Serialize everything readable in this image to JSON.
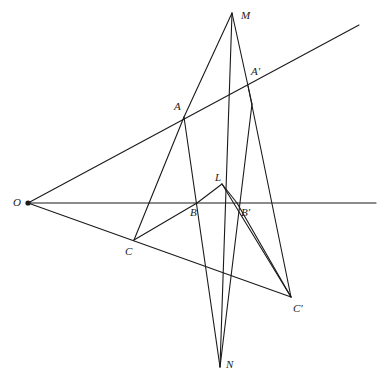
{
  "figure": {
    "kind": "geometry-diagram",
    "background_color": "#ffffff",
    "stroke_color": "#1a1a1a",
    "stroke_width": 1.1,
    "canvas": {
      "width": 382,
      "height": 383
    }
  },
  "points": [
    {
      "id": "O",
      "label": "O",
      "x": 28,
      "y": 203,
      "label_x": 13,
      "label_y": 197,
      "dot": true
    },
    {
      "id": "M",
      "label": "M",
      "x": 232,
      "y": 13,
      "label_x": 241,
      "label_y": 10,
      "dot": false
    },
    {
      "id": "Ap",
      "label": "A′",
      "x": 248,
      "y": 86,
      "label_x": 251,
      "label_y": 66,
      "dot": false
    },
    {
      "id": "A",
      "label": "A",
      "x": 184,
      "y": 117,
      "label_x": 174,
      "label_y": 101,
      "dot": false
    },
    {
      "id": "L",
      "label": "L",
      "x": 222,
      "y": 184,
      "label_x": 215,
      "label_y": 172,
      "dot": false
    },
    {
      "id": "B",
      "label": "B",
      "x": 197,
      "y": 203,
      "label_x": 190,
      "label_y": 207,
      "dot": false
    },
    {
      "id": "Bp",
      "label": "B′",
      "x": 237,
      "y": 203,
      "label_x": 241,
      "label_y": 207,
      "dot": false
    },
    {
      "id": "C",
      "label": "C",
      "x": 134,
      "y": 240,
      "label_x": 125,
      "label_y": 246,
      "dot": false
    },
    {
      "id": "Cp",
      "label": "C′",
      "x": 291,
      "y": 297,
      "label_x": 293,
      "label_y": 303,
      "dot": false
    },
    {
      "id": "N",
      "label": "N",
      "x": 220,
      "y": 367,
      "label_x": 226,
      "label_y": 359,
      "dot": false
    }
  ],
  "segments": [
    {
      "name": "line-O-horizontal-axis",
      "x1": 28,
      "y1": 203,
      "x2": 376,
      "y2": 203
    },
    {
      "name": "line-O-through-A-to-Ap",
      "x1": 28,
      "y1": 203,
      "x2": 359,
      "y2": 25
    },
    {
      "name": "line-O-through-C-to-Cp",
      "x1": 28,
      "y1": 203,
      "x2": 291,
      "y2": 297
    },
    {
      "name": "segment-M-to-A",
      "x1": 232,
      "y1": 13,
      "x2": 184,
      "y2": 117
    },
    {
      "name": "segment-A-to-C",
      "x1": 184,
      "y1": 117,
      "x2": 134,
      "y2": 240
    },
    {
      "name": "segment-C-to-B",
      "x1": 134,
      "y1": 240,
      "x2": 197,
      "y2": 203
    },
    {
      "name": "segment-B-to-L",
      "x1": 197,
      "y1": 203,
      "x2": 222,
      "y2": 184
    },
    {
      "name": "segment-L-to-Bp",
      "x1": 222,
      "y1": 184,
      "x2": 237,
      "y2": 203
    },
    {
      "name": "segment-L-to-Cp",
      "x1": 222,
      "y1": 184,
      "x2": 291,
      "y2": 297
    },
    {
      "name": "segment-M-to-N-left",
      "x1": 232,
      "y1": 13,
      "x2": 220,
      "y2": 367
    },
    {
      "name": "segment-A-to-N",
      "x1": 184,
      "y1": 117,
      "x2": 220,
      "y2": 367
    },
    {
      "name": "segment-M-through-Ap",
      "x1": 232,
      "y1": 13,
      "x2": 252,
      "y2": 104
    },
    {
      "name": "segment-Ap-to-N",
      "x1": 252,
      "y1": 104,
      "x2": 220,
      "y2": 367
    },
    {
      "name": "segment-Ap-to-Cp",
      "x1": 248,
      "y1": 86,
      "x2": 291,
      "y2": 297
    },
    {
      "name": "segment-Bp-to-Cp",
      "x1": 237,
      "y1": 203,
      "x2": 291,
      "y2": 297
    }
  ]
}
